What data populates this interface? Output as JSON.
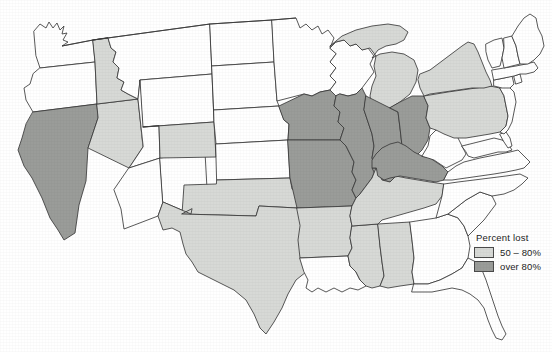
{
  "figure": {
    "type": "choropleth-map",
    "region": "contiguous-united-states",
    "title": "",
    "background_color": "#ffffff",
    "outline_color": "#3b3b3b"
  },
  "legend": {
    "title": "Percent  lost",
    "position": "bottom-right",
    "items": [
      {
        "label": "50 – 80%",
        "class": "light",
        "color": "#d7d9d6",
        "key": "50-80"
      },
      {
        "label": "over 80%",
        "class": "dark",
        "color": "#9a9c99",
        "key": "over-80"
      }
    ]
  },
  "classification": {
    "none": "#ffffff",
    "light": "#d7d9d6",
    "dark": "#9a9c99"
  },
  "map_data": {
    "type": "choropleth",
    "value_classes": [
      "none",
      "50 – 80%",
      "over 80%"
    ],
    "states": [
      {
        "code": "WA",
        "name": "Washington",
        "class": "none"
      },
      {
        "code": "OR",
        "name": "Oregon",
        "class": "none"
      },
      {
        "code": "CA",
        "name": "California",
        "class": "dark"
      },
      {
        "code": "NV",
        "name": "Nevada",
        "class": "light"
      },
      {
        "code": "ID",
        "name": "Idaho",
        "class": "light"
      },
      {
        "code": "MT",
        "name": "Montana",
        "class": "none"
      },
      {
        "code": "WY",
        "name": "Wyoming",
        "class": "none"
      },
      {
        "code": "UT",
        "name": "Utah",
        "class": "none"
      },
      {
        "code": "AZ",
        "name": "Arizona",
        "class": "none"
      },
      {
        "code": "NM",
        "name": "New Mexico",
        "class": "none"
      },
      {
        "code": "CO",
        "name": "Colorado",
        "class": "light"
      },
      {
        "code": "ND",
        "name": "North Dakota",
        "class": "none"
      },
      {
        "code": "SD",
        "name": "South Dakota",
        "class": "none"
      },
      {
        "code": "NE",
        "name": "Nebraska",
        "class": "none"
      },
      {
        "code": "KS",
        "name": "Kansas",
        "class": "none"
      },
      {
        "code": "OK",
        "name": "Oklahoma",
        "class": "light"
      },
      {
        "code": "TX",
        "name": "Texas",
        "class": "light"
      },
      {
        "code": "MN",
        "name": "Minnesota",
        "class": "none"
      },
      {
        "code": "IA",
        "name": "Iowa",
        "class": "dark"
      },
      {
        "code": "MO",
        "name": "Missouri",
        "class": "dark"
      },
      {
        "code": "AR",
        "name": "Arkansas",
        "class": "light"
      },
      {
        "code": "LA",
        "name": "Louisiana",
        "class": "none"
      },
      {
        "code": "WI",
        "name": "Wisconsin",
        "class": "none"
      },
      {
        "code": "IL",
        "name": "Illinois",
        "class": "dark"
      },
      {
        "code": "MI",
        "name": "Michigan",
        "class": "light"
      },
      {
        "code": "IN",
        "name": "Indiana",
        "class": "dark"
      },
      {
        "code": "OH",
        "name": "Ohio",
        "class": "dark"
      },
      {
        "code": "KY",
        "name": "Kentucky",
        "class": "dark"
      },
      {
        "code": "TN",
        "name": "Tennessee",
        "class": "light"
      },
      {
        "code": "MS",
        "name": "Mississippi",
        "class": "light"
      },
      {
        "code": "AL",
        "name": "Alabama",
        "class": "light"
      },
      {
        "code": "GA",
        "name": "Georgia",
        "class": "none"
      },
      {
        "code": "FL",
        "name": "Florida",
        "class": "none"
      },
      {
        "code": "SC",
        "name": "South Carolina",
        "class": "none"
      },
      {
        "code": "NC",
        "name": "North Carolina",
        "class": "none"
      },
      {
        "code": "VA",
        "name": "Virginia",
        "class": "none"
      },
      {
        "code": "WV",
        "name": "West Virginia",
        "class": "none"
      },
      {
        "code": "MD",
        "name": "Maryland",
        "class": "none"
      },
      {
        "code": "DE",
        "name": "Delaware",
        "class": "none"
      },
      {
        "code": "PA",
        "name": "Pennsylvania",
        "class": "light"
      },
      {
        "code": "NJ",
        "name": "New Jersey",
        "class": "none"
      },
      {
        "code": "NY",
        "name": "New York",
        "class": "light"
      },
      {
        "code": "CT",
        "name": "Connecticut",
        "class": "none"
      },
      {
        "code": "RI",
        "name": "Rhode Island",
        "class": "none"
      },
      {
        "code": "MA",
        "name": "Massachusetts",
        "class": "none"
      },
      {
        "code": "VT",
        "name": "Vermont",
        "class": "none"
      },
      {
        "code": "NH",
        "name": "New Hampshire",
        "class": "none"
      },
      {
        "code": "ME",
        "name": "Maine",
        "class": "none"
      }
    ]
  }
}
